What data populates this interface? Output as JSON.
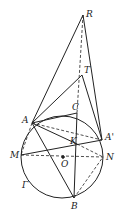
{
  "diagram": {
    "circle": {
      "name": "Γ",
      "cx": 62,
      "cy": 157,
      "r": 41
    },
    "points": {
      "R": {
        "x": 83,
        "y": 15,
        "label": "R"
      },
      "T": {
        "x": 82,
        "y": 75,
        "label": "T"
      },
      "C": {
        "x": 77,
        "y": 113,
        "label": "C"
      },
      "A": {
        "x": 32,
        "y": 123,
        "label": "A"
      },
      "A_prime": {
        "x": 102,
        "y": 140,
        "label": "A'"
      },
      "K": {
        "x": 77,
        "y": 144,
        "label": "K"
      },
      "M": {
        "x": 21,
        "y": 155,
        "label": "M"
      },
      "N": {
        "x": 103,
        "y": 157,
        "label": "N"
      },
      "O": {
        "x": 63,
        "y": 157,
        "label": "O"
      },
      "B": {
        "x": 74,
        "y": 198,
        "label": "B"
      }
    },
    "circle_label": "Γ",
    "solid_segments": [
      [
        "R",
        "A"
      ],
      [
        "R",
        "A_prime"
      ],
      [
        "T",
        "A"
      ],
      [
        "T",
        "A_prime"
      ],
      [
        "A",
        "C"
      ],
      [
        "C",
        "B"
      ],
      [
        "A",
        "K"
      ],
      [
        "A",
        "B"
      ],
      [
        "M",
        "A_prime"
      ]
    ],
    "dashed_segments": [
      [
        "R",
        "C"
      ],
      [
        "A",
        "A_prime"
      ],
      [
        "A",
        "M"
      ],
      [
        "M",
        "N"
      ],
      [
        "K",
        "N"
      ],
      [
        "B",
        "N"
      ]
    ]
  }
}
